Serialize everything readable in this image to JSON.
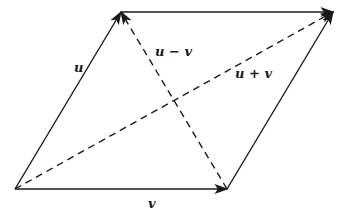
{
  "diagram": {
    "colors": {
      "stroke": "#1a1a1a",
      "background": "#ffffff"
    },
    "points": {
      "origin": [
        15,
        189
      ],
      "v_end": [
        227,
        189
      ],
      "u_end": [
        121,
        12
      ],
      "sum_end": [
        333,
        12
      ]
    },
    "vectors": [
      {
        "id": "u",
        "label": "u",
        "style": "solid",
        "from": "origin",
        "to": "u_end"
      },
      {
        "id": "v",
        "label": "v",
        "style": "solid",
        "from": "origin",
        "to": "v_end"
      },
      {
        "id": "u-top",
        "label": "",
        "style": "solid",
        "from": "u_end",
        "to": "sum_end"
      },
      {
        "id": "v-right",
        "label": "",
        "style": "solid",
        "from": "v_end",
        "to": "sum_end"
      },
      {
        "id": "u-minus-v",
        "label": "u − v",
        "style": "dashed",
        "from": "v_end",
        "to": "u_end"
      },
      {
        "id": "u-plus-v",
        "label": "u + v",
        "style": "dashed",
        "from": "origin",
        "to": "sum_end"
      }
    ],
    "labels": {
      "u": "u",
      "v": "v",
      "u_minus_v": "u − v",
      "u_plus_v": "u + v"
    }
  }
}
